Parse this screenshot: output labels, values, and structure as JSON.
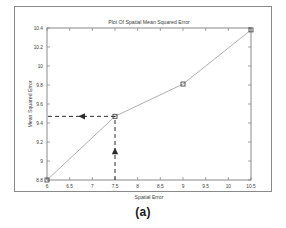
{
  "figure": {
    "caption": "(a)",
    "frame_color": "#8a8a8a",
    "background": "#ffffff"
  },
  "chart_data": {
    "type": "line",
    "title": "Plot Of Spatial Mean Squared Error",
    "xlabel": "Spatial Error",
    "ylabel": "Mean Squared Error",
    "x": [
      6,
      7.5,
      9,
      10.5
    ],
    "values": [
      8.8,
      9.47,
      9.81,
      10.38
    ],
    "series": [
      {
        "name": "Spatial Mean Squared Error",
        "x": [
          6,
          7.5,
          9,
          10.5
        ],
        "values": [
          8.8,
          9.47,
          9.81,
          10.38
        ]
      }
    ],
    "xlim": [
      6,
      10.5
    ],
    "ylim": [
      8.8,
      10.4
    ],
    "xticks": [
      "6",
      "6.5",
      "7",
      "7.5",
      "8",
      "8.5",
      "9",
      "9.5",
      "10",
      "10.5"
    ],
    "xtick_values": [
      6,
      6.5,
      7,
      7.5,
      8,
      8.5,
      9,
      9.5,
      10,
      10.5
    ],
    "yticks": [
      "8.8",
      "9",
      "9.2",
      "9.4",
      "9.6",
      "9.8",
      "10",
      "10.2",
      "10.4"
    ],
    "ytick_values": [
      8.8,
      9,
      9.2,
      9.4,
      9.6,
      9.8,
      10,
      10.2,
      10.4
    ],
    "grid": false,
    "legend": null,
    "marker": "square",
    "line_color": "#9a9a9a",
    "marker_color": "#4a4a4a",
    "annotations": [
      {
        "name": "horizontal-guide",
        "style": "dashed-arrow",
        "from_x": 7.5,
        "from_y": 9.47,
        "to_x": 6,
        "to_y": 9.47,
        "direction": "left",
        "color": "#2b2b2b"
      },
      {
        "name": "vertical-guide",
        "style": "dashed-arrow",
        "from_x": 7.5,
        "from_y": 8.8,
        "to_x": 7.5,
        "to_y": 9.47,
        "direction": "up",
        "color": "#2b2b2b"
      }
    ]
  }
}
